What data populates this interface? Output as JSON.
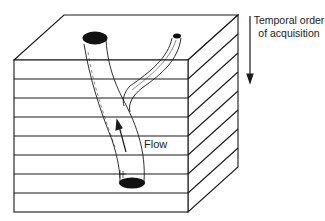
{
  "diagram": {
    "labels": {
      "temporal_line1": "Temporal order",
      "temporal_line2": "of acquisition",
      "flow": "Flow"
    },
    "layers": 8,
    "colors": {
      "stroke": "#1a1a1a",
      "fill": "#ffffff",
      "hole": "#111111"
    }
  }
}
